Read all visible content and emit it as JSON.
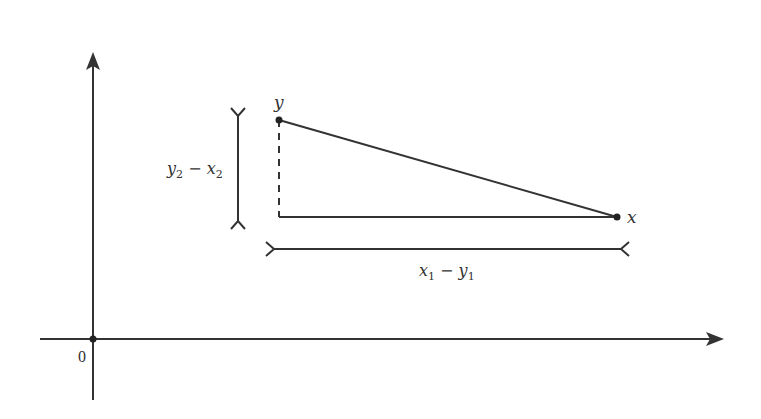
{
  "diagram": {
    "title": "",
    "origin_label": "0",
    "points": [
      {
        "id": "y",
        "label": "y"
      },
      {
        "id": "x",
        "label": "x"
      }
    ],
    "vertical_measure": {
      "base": "y",
      "sub1": "2",
      "op": " − ",
      "base2": "x",
      "sub2": "2"
    },
    "horizontal_measure": {
      "base": "x",
      "sub1": "1",
      "op": " − ",
      "base2": "y",
      "sub2": "1"
    },
    "colors": {
      "stroke": "#333333",
      "background": "#ffffff"
    }
  }
}
